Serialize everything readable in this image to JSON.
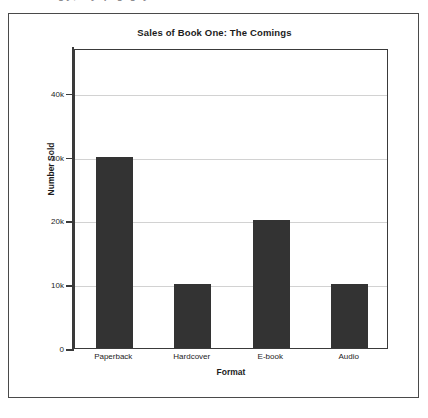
{
  "figure": {
    "clipped_caption_fragment": "gy, by p g g y",
    "background_color": "#ffffff",
    "frame_color": "#4a4a4a"
  },
  "chart_data": {
    "type": "bar",
    "title": "Sales of Book One: The Comings",
    "xlabel": "Format",
    "ylabel": "Number Sold",
    "categories": [
      "Paperback",
      "Hardcover",
      "E-book",
      "Audio"
    ],
    "values": [
      30000,
      10000,
      20000,
      10000
    ],
    "ylim": [
      0,
      47000
    ],
    "yticks": [
      0,
      10000,
      20000,
      30000,
      40000
    ],
    "ytick_labels": [
      "0",
      "10k",
      "20k",
      "30k",
      "40k"
    ],
    "grid": true,
    "legend": "none",
    "bar_color": "#333333",
    "gridline_color": "#d2d2d2",
    "axis_color": "#3a3a3a",
    "plot_background": "#ffffff"
  }
}
